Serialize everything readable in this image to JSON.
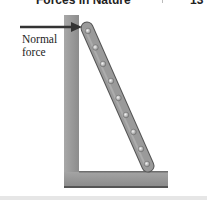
{
  "header": {
    "title": "Forces in Nature",
    "page_number": "13"
  },
  "figure": {
    "label_line1": "Normal",
    "label_line2": "force",
    "elements": [
      "wall",
      "floor",
      "ladder",
      "normal-force-arrow"
    ],
    "ladder_rivet_count": 9,
    "colors": {
      "wall": "#9a9a9a",
      "ladder": "#8f8f8f",
      "arrow": "#333333",
      "strip": "#e6e6e6"
    }
  }
}
